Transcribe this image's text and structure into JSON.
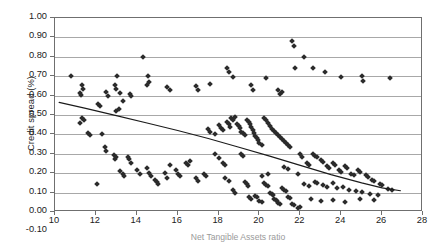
{
  "chart_data": {
    "type": "scatter",
    "title": "",
    "xlabel": "Net Tangible Assets ratio",
    "ylabel": "Credit spread (%)",
    "xlim": [
      10,
      28
    ],
    "ylim": [
      -0.1,
      1.0
    ],
    "xticks": [
      10,
      12,
      14,
      16,
      18,
      20,
      22,
      24,
      26,
      28
    ],
    "xtick_labels": [
      "10",
      "12",
      "14",
      "16",
      "18",
      "20",
      "22",
      "24",
      "26",
      "28"
    ],
    "yticks": [
      -0.1,
      0.0,
      0.1,
      0.2,
      0.3,
      0.4,
      0.5,
      0.6,
      0.7,
      0.8,
      0.9,
      1.0
    ],
    "ytick_labels": [
      "-0.10",
      "0.00",
      "0.10",
      "0.20",
      "0.30",
      "0.40",
      "0.50",
      "0.60",
      "0.70",
      "0.80",
      "0.90",
      "1.00"
    ],
    "grid": "horizontal",
    "legend": "none",
    "marker": "diamond",
    "marker_color": "#2b2b2b",
    "gridline_color": "#a8a8a8",
    "frame_color": "#6f6f6f",
    "plot_axis_visible_ymin": 0.0,
    "plot_axis_visible_ymax": 1.0,
    "trendline": {
      "type": "polynomial",
      "color": "#1b1b1b",
      "points": [
        [
          10.2,
          0.565
        ],
        [
          11.5,
          0.534
        ],
        [
          13.0,
          0.497
        ],
        [
          14.5,
          0.459
        ],
        [
          16.0,
          0.42
        ],
        [
          17.5,
          0.379
        ],
        [
          19.0,
          0.334
        ],
        [
          20.5,
          0.288
        ],
        [
          22.0,
          0.24
        ],
        [
          23.5,
          0.193
        ],
        [
          25.0,
          0.15
        ],
        [
          26.0,
          0.124
        ],
        [
          26.9,
          0.11
        ]
      ]
    },
    "series": [
      {
        "name": "Credit spread vs NTA ratio",
        "points": [
          [
            10.8,
            0.7
          ],
          [
            11.3,
            0.655
          ],
          [
            11.35,
            0.635
          ],
          [
            11.2,
            0.615
          ],
          [
            11.25,
            0.605
          ],
          [
            12.5,
            0.62
          ],
          [
            12.6,
            0.6
          ],
          [
            12.95,
            0.655
          ],
          [
            13.0,
            0.635
          ],
          [
            13.05,
            0.7
          ],
          [
            13.2,
            0.615
          ],
          [
            13.3,
            0.575
          ],
          [
            13.65,
            0.61
          ],
          [
            13.7,
            0.6
          ],
          [
            14.3,
            0.8
          ],
          [
            14.5,
            0.655
          ],
          [
            14.55,
            0.7
          ],
          [
            14.6,
            0.67
          ],
          [
            15.5,
            0.645
          ],
          [
            15.6,
            0.63
          ],
          [
            16.9,
            0.65
          ],
          [
            17.0,
            0.63
          ],
          [
            17.6,
            0.66
          ],
          [
            18.4,
            0.74
          ],
          [
            18.5,
            0.72
          ],
          [
            18.7,
            0.695
          ],
          [
            19.6,
            0.655
          ],
          [
            19.7,
            0.63
          ],
          [
            20.3,
            0.69
          ],
          [
            20.9,
            0.63
          ],
          [
            21.0,
            0.61
          ],
          [
            21.1,
            0.62
          ],
          [
            21.6,
            0.88
          ],
          [
            21.7,
            0.855
          ],
          [
            21.75,
            0.745
          ],
          [
            22.2,
            0.8
          ],
          [
            22.6,
            0.745
          ],
          [
            23.2,
            0.72
          ],
          [
            24.0,
            0.695
          ],
          [
            25.0,
            0.7
          ],
          [
            25.05,
            0.675
          ],
          [
            26.4,
            0.69
          ],
          [
            11.2,
            0.46
          ],
          [
            11.6,
            0.41
          ],
          [
            11.7,
            0.395
          ],
          [
            12.3,
            0.4
          ],
          [
            12.45,
            0.335
          ],
          [
            12.5,
            0.315
          ],
          [
            12.9,
            0.295
          ],
          [
            12.95,
            0.275
          ],
          [
            13.0,
            0.285
          ],
          [
            13.2,
            0.21
          ],
          [
            13.3,
            0.195
          ],
          [
            13.35,
            0.185
          ],
          [
            13.55,
            0.285
          ],
          [
            13.6,
            0.275
          ],
          [
            13.7,
            0.255
          ],
          [
            14.0,
            0.215
          ],
          [
            14.15,
            0.195
          ],
          [
            14.5,
            0.225
          ],
          [
            14.6,
            0.2
          ],
          [
            14.7,
            0.185
          ],
          [
            14.9,
            0.165
          ],
          [
            15.0,
            0.155
          ],
          [
            15.05,
            0.145
          ],
          [
            15.4,
            0.2
          ],
          [
            15.5,
            0.175
          ],
          [
            15.6,
            0.245
          ],
          [
            15.9,
            0.215
          ],
          [
            16.0,
            0.195
          ],
          [
            16.1,
            0.185
          ],
          [
            16.4,
            0.255
          ],
          [
            16.5,
            0.245
          ],
          [
            16.6,
            0.265
          ],
          [
            16.9,
            0.175
          ],
          [
            17.0,
            0.16
          ],
          [
            11.3,
            0.485
          ],
          [
            11.4,
            0.475
          ],
          [
            12.05,
            0.145
          ],
          [
            13.0,
            0.52
          ],
          [
            13.15,
            0.53
          ],
          [
            17.5,
            0.43
          ],
          [
            17.6,
            0.415
          ],
          [
            17.8,
            0.4
          ],
          [
            18.0,
            0.45
          ],
          [
            18.1,
            0.435
          ],
          [
            18.2,
            0.425
          ],
          [
            18.4,
            0.465
          ],
          [
            18.5,
            0.455
          ],
          [
            18.55,
            0.44
          ],
          [
            18.6,
            0.485
          ],
          [
            18.7,
            0.475
          ],
          [
            18.8,
            0.49
          ],
          [
            18.9,
            0.455
          ],
          [
            19.0,
            0.445
          ],
          [
            19.05,
            0.435
          ],
          [
            19.1,
            0.415
          ],
          [
            19.2,
            0.405
          ],
          [
            19.3,
            0.395
          ],
          [
            19.4,
            0.475
          ],
          [
            19.5,
            0.465
          ],
          [
            19.55,
            0.455
          ],
          [
            19.6,
            0.44
          ],
          [
            19.7,
            0.425
          ],
          [
            19.75,
            0.41
          ],
          [
            19.8,
            0.39
          ],
          [
            19.9,
            0.38
          ],
          [
            19.95,
            0.37
          ],
          [
            20.0,
            0.355
          ],
          [
            20.1,
            0.345
          ],
          [
            20.2,
            0.485
          ],
          [
            20.3,
            0.475
          ],
          [
            20.4,
            0.46
          ],
          [
            20.5,
            0.445
          ],
          [
            20.6,
            0.43
          ],
          [
            20.7,
            0.42
          ],
          [
            20.8,
            0.405
          ],
          [
            20.9,
            0.395
          ],
          [
            21.0,
            0.385
          ],
          [
            21.1,
            0.375
          ],
          [
            21.2,
            0.365
          ],
          [
            21.3,
            0.355
          ],
          [
            21.4,
            0.345
          ],
          [
            21.5,
            0.335
          ],
          [
            18.3,
            0.175
          ],
          [
            18.5,
            0.16
          ],
          [
            18.7,
            0.115
          ],
          [
            18.8,
            0.1
          ],
          [
            19.1,
            0.3
          ],
          [
            19.2,
            0.29
          ],
          [
            19.3,
            0.155
          ],
          [
            19.4,
            0.145
          ],
          [
            19.45,
            0.135
          ],
          [
            19.5,
            0.075
          ],
          [
            19.6,
            0.065
          ],
          [
            19.8,
            0.085
          ],
          [
            19.9,
            0.08
          ],
          [
            20.0,
            0.055
          ],
          [
            20.1,
            0.05
          ],
          [
            20.2,
            0.15
          ],
          [
            20.3,
            0.14
          ],
          [
            20.4,
            0.135
          ],
          [
            20.5,
            0.1
          ],
          [
            20.6,
            0.095
          ],
          [
            20.65,
            0.09
          ],
          [
            20.7,
            0.065
          ],
          [
            20.8,
            0.06
          ],
          [
            20.85,
            0.055
          ],
          [
            20.9,
            0.045
          ],
          [
            21.0,
            0.04
          ],
          [
            21.1,
            0.125
          ],
          [
            21.2,
            0.115
          ],
          [
            21.3,
            0.11
          ],
          [
            21.4,
            0.075
          ],
          [
            21.5,
            0.07
          ],
          [
            21.6,
            0.04
          ],
          [
            21.7,
            0.035
          ],
          [
            21.9,
            0.02
          ],
          [
            22.0,
            0.025
          ],
          [
            22.0,
            0.3
          ],
          [
            22.1,
            0.285
          ],
          [
            22.3,
            0.255
          ],
          [
            22.4,
            0.245
          ],
          [
            22.6,
            0.3
          ],
          [
            22.7,
            0.29
          ],
          [
            22.8,
            0.285
          ],
          [
            23.0,
            0.27
          ],
          [
            23.1,
            0.26
          ],
          [
            23.3,
            0.235
          ],
          [
            23.4,
            0.225
          ],
          [
            23.6,
            0.255
          ],
          [
            23.7,
            0.245
          ],
          [
            23.9,
            0.215
          ],
          [
            24.0,
            0.205
          ],
          [
            24.2,
            0.235
          ],
          [
            24.3,
            0.225
          ],
          [
            24.5,
            0.195
          ],
          [
            24.6,
            0.19
          ],
          [
            24.8,
            0.215
          ],
          [
            24.9,
            0.205
          ],
          [
            25.2,
            0.19
          ],
          [
            25.3,
            0.18
          ],
          [
            25.5,
            0.165
          ],
          [
            25.6,
            0.16
          ],
          [
            25.9,
            0.145
          ],
          [
            26.0,
            0.14
          ],
          [
            26.3,
            0.12
          ],
          [
            26.5,
            0.115
          ],
          [
            22.2,
            0.145
          ],
          [
            22.4,
            0.135
          ],
          [
            22.7,
            0.155
          ],
          [
            22.8,
            0.15
          ],
          [
            23.1,
            0.14
          ],
          [
            23.3,
            0.13
          ],
          [
            23.6,
            0.15
          ],
          [
            23.8,
            0.125
          ],
          [
            24.1,
            0.13
          ],
          [
            24.4,
            0.115
          ],
          [
            24.7,
            0.11
          ],
          [
            25.0,
            0.105
          ],
          [
            25.4,
            0.095
          ],
          [
            25.8,
            0.09
          ],
          [
            22.5,
            0.065
          ],
          [
            23.0,
            0.055
          ],
          [
            23.6,
            0.06
          ],
          [
            24.2,
            0.05
          ],
          [
            24.9,
            0.065
          ],
          [
            25.6,
            0.06
          ],
          [
            17.8,
            0.3
          ],
          [
            18.0,
            0.28
          ],
          [
            17.3,
            0.195
          ],
          [
            17.4,
            0.185
          ],
          [
            18.2,
            0.255
          ],
          [
            18.3,
            0.245
          ],
          [
            20.1,
            0.185
          ],
          [
            20.4,
            0.195
          ],
          [
            21.2,
            0.23
          ],
          [
            21.4,
            0.22
          ],
          [
            21.9,
            0.195
          ],
          [
            12.1,
            0.555
          ],
          [
            12.2,
            0.545
          ]
        ]
      }
    ]
  }
}
